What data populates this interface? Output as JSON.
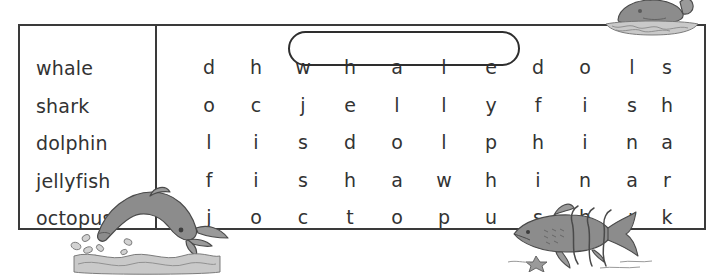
{
  "puzzle": {
    "type": "word-search",
    "word_list": [
      {
        "word": "whale",
        "found": true
      },
      {
        "word": "shark",
        "found": false
      },
      {
        "word": "dolphin",
        "found": false
      },
      {
        "word": "jellyfish",
        "found": false
      },
      {
        "word": "octopus",
        "found": false
      }
    ],
    "grid": {
      "rows": 5,
      "cols": 11,
      "letters": [
        [
          "d",
          "h",
          "w",
          "h",
          "a",
          "l",
          "e",
          "d",
          "o",
          "l",
          "s"
        ],
        [
          "o",
          "c",
          "j",
          "e",
          "l",
          "l",
          "y",
          "f",
          "i",
          "s",
          "h"
        ],
        [
          "l",
          "i",
          "s",
          "d",
          "o",
          "l",
          "p",
          "h",
          "i",
          "n",
          "a"
        ],
        [
          "f",
          "i",
          "s",
          "h",
          "a",
          "w",
          "h",
          "i",
          "n",
          "a",
          "r"
        ],
        [
          "j",
          "o",
          "c",
          "t",
          "o",
          "p",
          "u",
          "s",
          "h",
          "r",
          "k"
        ]
      ]
    },
    "found_marks": [
      {
        "word": "whale",
        "row": 0,
        "start_col": 2,
        "end_col": 6,
        "shape": "oval"
      }
    ],
    "illustrations": [
      {
        "name": "whale-illustration",
        "subject": "whale",
        "position": "top-right"
      },
      {
        "name": "dolphin-illustration",
        "subject": "dolphin",
        "position": "bottom-left"
      },
      {
        "name": "shark-illustration",
        "subject": "shark",
        "position": "bottom-right"
      }
    ],
    "colors": {
      "border": "#3a3a3a",
      "text": "#333333",
      "circle": "#2e2e2e",
      "illustration_fill": "#8c8c8c",
      "illustration_light": "#bfbfbf",
      "illustration_outline": "#4a4a4a",
      "background": "#ffffff"
    }
  }
}
